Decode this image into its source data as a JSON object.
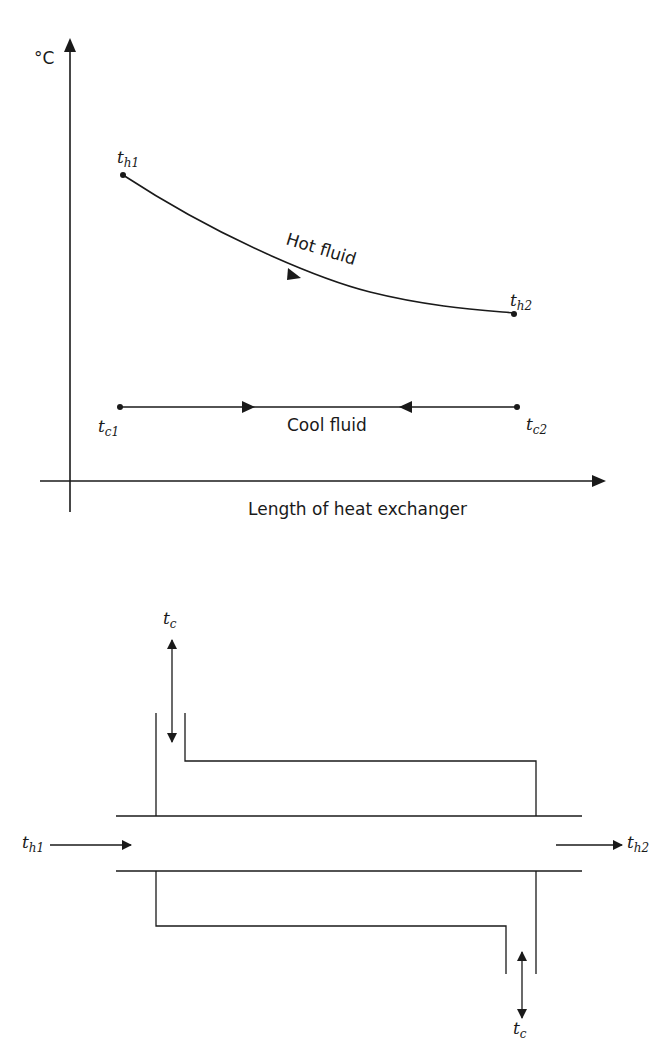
{
  "graph": {
    "y_axis_label": "°C",
    "x_axis_label": "Length of heat exchanger",
    "hot_fluid_label": "Hot fluid",
    "cool_fluid_label": "Cool fluid",
    "points": {
      "th1": {
        "base": "t",
        "sub": "h1"
      },
      "th2": {
        "base": "t",
        "sub": "h2"
      },
      "tc1": {
        "base": "t",
        "sub": "c1"
      },
      "tc2": {
        "base": "t",
        "sub": "c2"
      }
    }
  },
  "schematic": {
    "inlet_hot": {
      "base": "t",
      "sub": "h1"
    },
    "outlet_hot": {
      "base": "t",
      "sub": "h2"
    },
    "cool_top": {
      "base": "t",
      "sub": "c"
    },
    "cool_bottom": {
      "base": "t",
      "sub": "c"
    }
  },
  "colors": {
    "ink": "#1a1a1a",
    "background": "#ffffff"
  }
}
